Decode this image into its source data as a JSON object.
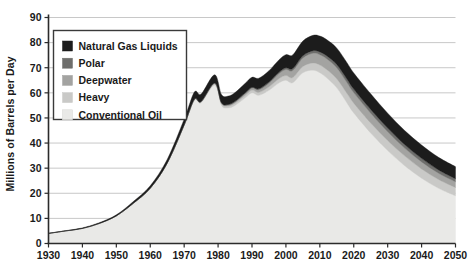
{
  "chart_data": {
    "type": "area",
    "stacked": true,
    "title": "",
    "xlabel": "",
    "ylabel": "Millions of Barrels per Day",
    "xlim": [
      1930,
      2050
    ],
    "ylim": [
      0,
      90
    ],
    "grid": true,
    "legend_position": "top-left",
    "xticks": [
      "1930",
      "1940",
      "1950",
      "1960",
      "1970",
      "1980",
      "1990",
      "2000",
      "2010",
      "2020",
      "2030",
      "2040",
      "2050"
    ],
    "yticks": [
      "0",
      "10",
      "20",
      "30",
      "40",
      "50",
      "60",
      "70",
      "80",
      "90"
    ],
    "x": [
      1930,
      1935,
      1940,
      1945,
      1950,
      1955,
      1960,
      1965,
      1970,
      1973,
      1975,
      1979,
      1981,
      1983,
      1985,
      1988,
      1990,
      1992,
      1995,
      1998,
      2000,
      2002,
      2005,
      2008,
      2010,
      2012,
      2015,
      2018,
      2020,
      2025,
      2030,
      2035,
      2040,
      2045,
      2050
    ],
    "series": [
      {
        "name": "Conventional Oil",
        "color": "#e9e9e7",
        "values": [
          4.0,
          5.0,
          6.0,
          8.0,
          11.0,
          16.0,
          22.0,
          32.0,
          47.0,
          57.0,
          56.0,
          63.0,
          55.0,
          54.0,
          55.0,
          58.0,
          60.0,
          59.0,
          61.0,
          64.0,
          65.0,
          64.0,
          68.0,
          69.0,
          68.0,
          66.0,
          62.0,
          56.0,
          52.0,
          44.0,
          37.0,
          31.0,
          26.0,
          22.0,
          19.0
        ]
      },
      {
        "name": "Heavy",
        "color": "#c9c9c7",
        "values": [
          0.0,
          0.0,
          0.0,
          0.0,
          0.0,
          0.0,
          0.0,
          0.0,
          0.2,
          0.3,
          0.4,
          0.6,
          0.7,
          0.8,
          0.9,
          1.0,
          1.1,
          1.2,
          1.4,
          1.7,
          1.9,
          2.1,
          2.5,
          2.9,
          3.1,
          3.3,
          3.6,
          3.8,
          3.9,
          4.0,
          4.0,
          3.9,
          3.7,
          3.5,
          3.3
        ]
      },
      {
        "name": "Deepwater",
        "color": "#a3a3a1",
        "values": [
          0.0,
          0.0,
          0.0,
          0.0,
          0.0,
          0.0,
          0.0,
          0.0,
          0.0,
          0.1,
          0.1,
          0.2,
          0.3,
          0.4,
          0.5,
          0.7,
          0.8,
          1.0,
          1.4,
          2.0,
          2.4,
          2.8,
          3.4,
          3.9,
          4.1,
          4.3,
          4.4,
          4.3,
          4.2,
          3.9,
          3.5,
          3.1,
          2.8,
          2.5,
          2.3
        ]
      },
      {
        "name": "Polar",
        "color": "#6e6e6c",
        "values": [
          0.0,
          0.0,
          0.0,
          0.0,
          0.0,
          0.0,
          0.0,
          0.0,
          0.0,
          0.0,
          0.0,
          0.1,
          0.1,
          0.2,
          0.2,
          0.3,
          0.3,
          0.4,
          0.5,
          0.6,
          0.7,
          0.8,
          0.9,
          1.0,
          1.1,
          1.2,
          1.3,
          1.4,
          1.4,
          1.5,
          1.5,
          1.4,
          1.4,
          1.3,
          1.2
        ]
      },
      {
        "name": "Natural Gas Liquids",
        "color": "#1c1c1c",
        "values": [
          0.1,
          0.1,
          0.2,
          0.3,
          0.4,
          0.7,
          1.0,
          1.5,
          2.3,
          2.9,
          3.0,
          3.3,
          3.2,
          3.3,
          3.5,
          3.8,
          4.0,
          4.2,
          4.5,
          4.9,
          5.2,
          5.4,
          5.8,
          6.1,
          6.3,
          6.4,
          6.5,
          6.5,
          6.4,
          6.2,
          5.9,
          5.6,
          5.3,
          5.0,
          4.8
        ]
      }
    ]
  },
  "legend": {
    "items": [
      {
        "label": "Natural Gas Liquids",
        "color": "#1c1c1c"
      },
      {
        "label": "Polar",
        "color": "#6e6e6c"
      },
      {
        "label": "Deepwater",
        "color": "#a3a3a1"
      },
      {
        "label": "Heavy",
        "color": "#c9c9c7"
      },
      {
        "label": "Conventional Oil",
        "color": "#e9e9e7"
      }
    ]
  },
  "axes": {
    "ylabel": "Millions of Barrels per Day"
  }
}
